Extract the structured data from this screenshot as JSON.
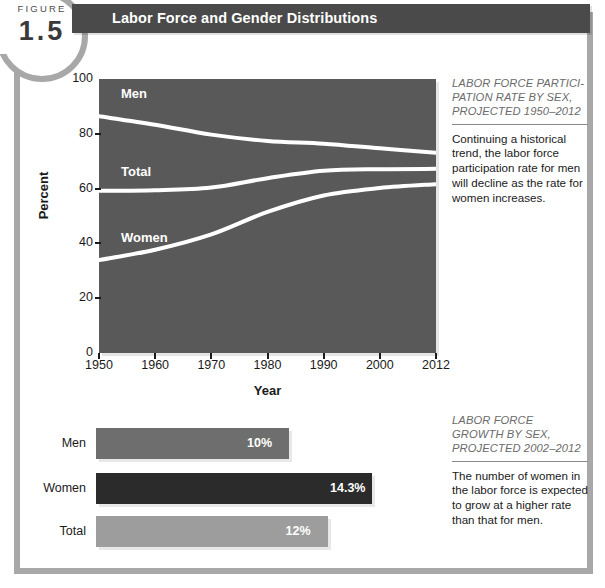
{
  "figure": {
    "word": "FIGURE",
    "number": "1.5",
    "title": "Labor Force and Gender Distributions"
  },
  "chart_data": [
    {
      "type": "line",
      "title": "Labor Force Participation Rate by Sex, Projected 1950-2012",
      "xlabel": "Year",
      "ylabel": "Percent",
      "ylim": [
        0,
        100
      ],
      "yticks": [
        0,
        20,
        40,
        60,
        80,
        100
      ],
      "xticks": [
        "1950",
        "1960",
        "1970",
        "1980",
        "1990",
        "2000",
        "2012"
      ],
      "x": [
        1950,
        1960,
        1970,
        1980,
        1990,
        2000,
        2012
      ],
      "grid": false,
      "legend": "inline-labels",
      "series": [
        {
          "name": "Men",
          "values": [
            86.4,
            83.3,
            79.7,
            77.4,
            76.4,
            74.7,
            73.1
          ],
          "endpoint_label": "73.1",
          "color": "#ffffff"
        },
        {
          "name": "Total",
          "values": [
            59.2,
            59.4,
            60.4,
            63.8,
            66.5,
            67.1,
            67.2
          ],
          "endpoint_label": "67.2",
          "color": "#ffffff"
        },
        {
          "name": "Women",
          "values": [
            33.9,
            37.7,
            43.3,
            51.5,
            57.5,
            60.2,
            61.6
          ],
          "endpoint_label": "61.6",
          "color": "#ffffff"
        }
      ]
    },
    {
      "type": "bar",
      "orientation": "horizontal",
      "title": "Labor Force Growth by Sex, Projected 2002-2012",
      "categories": [
        "Men",
        "Women",
        "Total"
      ],
      "values": [
        10,
        14.3,
        12
      ],
      "value_labels": [
        "10%",
        "14.3%",
        "12%"
      ],
      "colors": [
        "#6e6e6e",
        "#2b2b2b",
        "#9d9d9d"
      ],
      "xlabel": "",
      "ylabel": ""
    }
  ],
  "annotations": [
    {
      "heading": "LABOR FORCE PARTICI-PATION RATE BY SEX, PROJECTED 1950–2012",
      "body": "Continuing a historical trend, the labor force participation rate for men will decline as the rate for women increases."
    },
    {
      "heading": "LABOR FORCE GROWTH BY SEX, PROJECTED 2002–2012",
      "body": "The number of women in the labor force is expected to grow at a higher rate than that for men."
    }
  ],
  "colors": {
    "plot_background": "#595959",
    "title_bar": "#4a4a4a",
    "frame": "#a8a8a8",
    "line": "#ffffff",
    "bar_men": "#6e6e6e",
    "bar_women": "#2b2b2b",
    "bar_total": "#9d9d9d"
  }
}
